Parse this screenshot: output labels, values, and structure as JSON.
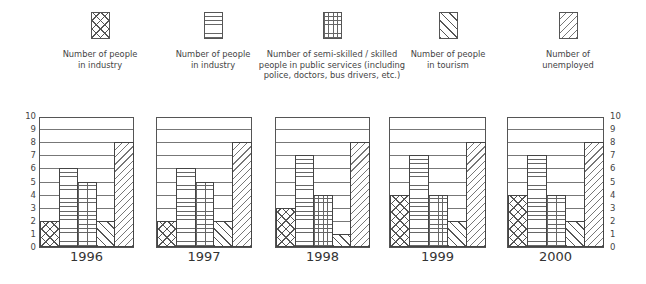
{
  "legend": [
    {
      "label_line1": "Number of people",
      "label_line2": "in industry",
      "label_line3": "",
      "pattern": "cross-hatch"
    },
    {
      "label_line1": "Number of people",
      "label_line2": "in industry",
      "label_line3": "",
      "pattern": "horizontal-lines"
    },
    {
      "label_line1": "Number of semi-skilled / skilled",
      "label_line2": "people in public services (including",
      "label_line3": "police, doctors, bus drivers, etc.)",
      "pattern": "grid"
    },
    {
      "label_line1": "Number of people",
      "label_line2": "in tourism",
      "label_line3": "",
      "pattern": "diagonal-back"
    },
    {
      "label_line1": "Number of",
      "label_line2": "unemployed",
      "label_line3": "",
      "pattern": "diagonal-forward"
    }
  ],
  "axis_ticks": [
    "0",
    "1",
    "2",
    "3",
    "4",
    "5",
    "6",
    "7",
    "8",
    "9",
    "10"
  ],
  "chart_data": {
    "type": "bar",
    "title": "",
    "xlabel": "",
    "ylabel": "",
    "ylim": [
      0,
      10
    ],
    "grid": true,
    "legend_position": "top",
    "categories": [
      "1996",
      "1997",
      "1998",
      "1999",
      "2000"
    ],
    "series": [
      {
        "name": "Number of people in industry (cross-hatch)",
        "values": [
          2,
          2,
          3,
          4,
          4
        ]
      },
      {
        "name": "Number of people in industry (horizontal lines)",
        "values": [
          6,
          6,
          7,
          7,
          7
        ]
      },
      {
        "name": "Number of semi-skilled / skilled people in public services (including police, doctors, bus drivers, etc.)",
        "values": [
          5,
          5,
          4,
          4,
          4
        ]
      },
      {
        "name": "Number of people in tourism",
        "values": [
          2,
          2,
          1,
          2,
          2
        ]
      },
      {
        "name": "Number of unemployed",
        "values": [
          8,
          8,
          8,
          8,
          8
        ]
      }
    ],
    "y_tick_labels": [
      "0",
      "1",
      "2",
      "3",
      "4",
      "5",
      "6",
      "7",
      "8",
      "9",
      "10"
    ],
    "axis_labels_position": "left of first panel and right of last panel"
  }
}
